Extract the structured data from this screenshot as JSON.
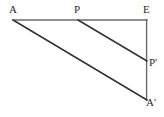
{
  "figure": {
    "kind": "geometry-diagram",
    "width": 164,
    "height": 117,
    "background_color": "#ffffff",
    "stroke_color_frame": "#6b6b6b",
    "stroke_color_diagonal": "#333333",
    "labels": {
      "a": "A",
      "p": "P",
      "e": "E",
      "p_prime": "P'",
      "a_prime": "A'"
    },
    "points": {
      "a": {
        "x": 13,
        "y": 20
      },
      "p": {
        "x": 78,
        "y": 20
      },
      "e": {
        "x": 147,
        "y": 20
      },
      "p_prime": {
        "x": 147,
        "y": 61
      },
      "a_prime": {
        "x": 147,
        "y": 100
      }
    },
    "segments": [
      {
        "name": "A-E",
        "from": "a",
        "to": "e",
        "color": "#6b6b6b",
        "width": 1.4
      },
      {
        "name": "E-A'",
        "from": "e",
        "to": "a_prime",
        "color": "#6b6b6b",
        "width": 1.4
      },
      {
        "name": "A-A'",
        "from": "a",
        "to": "a_prime",
        "color": "#333333",
        "width": 1.5
      },
      {
        "name": "P-P'",
        "from": "p",
        "to": "p_prime",
        "color": "#333333",
        "width": 1.5
      }
    ]
  }
}
